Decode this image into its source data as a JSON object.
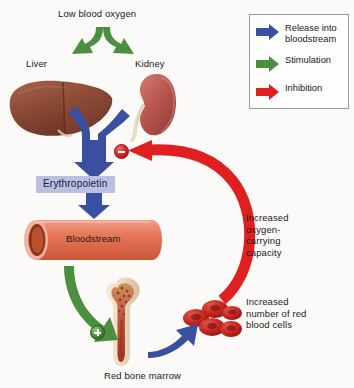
{
  "diagram": {
    "background_color": "#fbfaf8"
  },
  "legend": {
    "border_color": "#9b9b9b",
    "items": [
      {
        "label": "Release into bloodstream",
        "color": "#3b4fa0",
        "icon": "blue-arrow-icon"
      },
      {
        "label": "Stimulation",
        "color": "#4a9040",
        "icon": "green-arrow-icon"
      },
      {
        "label": "Inhibition",
        "color": "#e02020",
        "icon": "red-arrow-icon"
      }
    ]
  },
  "labels": {
    "low_blood_oxygen": "Low blood oxygen",
    "liver": "Liver",
    "kidney": "Kidney",
    "erythropoietin": "Erythropoietin",
    "bloodstream": "Bloodstream",
    "red_bone_marrow": "Red bone marrow",
    "increased_oxygen_capacity": "Increased oxygen-carrying capacity",
    "increased_rbc": "Increased number of red blood cells"
  },
  "badges": {
    "inhibition_sign": "minus",
    "stimulation_sign": "plus"
  },
  "colors": {
    "blue_arrow": "#3b4fa0",
    "green_arrow": "#4a9040",
    "red_arrow": "#e02020",
    "epo_chip_bg": "#bcc0e0",
    "vessel": "#e8795a",
    "liver": "#8c4a35",
    "kidney": "#b9564f",
    "rbc": "#c3231e"
  }
}
